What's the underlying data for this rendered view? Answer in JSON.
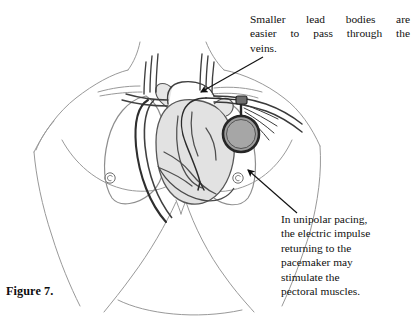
{
  "figure": {
    "caption": "Figure 7.",
    "background_color": "#ffffff",
    "width": 412,
    "height": 324
  },
  "callouts": [
    {
      "id": "veins",
      "name": "callout-smaller-lead-bodies",
      "lines": [
        "Smaller lead bodies are",
        "easier to pass through the",
        "veins."
      ],
      "justified_words": [
        [
          "Smaller",
          "lead",
          "bodies",
          "are"
        ],
        [
          "easier",
          "to",
          "pass",
          "through",
          "the"
        ],
        [
          "veins."
        ]
      ],
      "full_text": "Smaller lead bodies are easier to pass through the veins.",
      "arrow_target": "subclavian-vein-entry"
    },
    {
      "id": "unipolar",
      "name": "callout-unipolar-pacing",
      "lines": [
        "In unipolar pacing,",
        "the electric impulse",
        "returning to the",
        "pacemaker may",
        "stimulate the",
        "pectoral muscles."
      ],
      "full_text": "In unipolar pacing, the electric impulse returning to the pacemaker may stimulate the pectoral muscles.",
      "arrow_target": "pectoral-muscle-region"
    }
  ],
  "illustration": {
    "subject": "female-torso-anterior-view",
    "label": "Anterior view of chest showing implanted pacemaker with transvenous leads",
    "colors": {
      "body_outline": "#8a8a8a",
      "body_outline_light": "#a8a8a8",
      "vessel_outline": "#3a3a3a",
      "vessel_fill": "#e8e8e8",
      "heart_fill": "#e0e0e0",
      "heart_outline": "#4a4a4a",
      "lung_outline": "#9a9a9a",
      "device_ring": "#2b2b2b",
      "device_fill": "#9e9e9e",
      "lead_wire": "#2f2f2f",
      "arrow": "#111111"
    },
    "parts": [
      {
        "name": "torso-outline",
        "label": "Torso and shoulders outline"
      },
      {
        "name": "left-lung",
        "label": "Left lung (viewer right)"
      },
      {
        "name": "right-lung",
        "label": "Right lung (viewer left)"
      },
      {
        "name": "heart",
        "label": "Heart with chambers"
      },
      {
        "name": "great-vessels",
        "label": "Aortic arch and great vessels"
      },
      {
        "name": "subclavian-vein",
        "label": "Subclavian vein"
      },
      {
        "name": "pacemaker-device",
        "label": "Implanted pacemaker generator (can)"
      },
      {
        "name": "pacemaker-lead",
        "label": "Transvenous pacing lead into right ventricle"
      },
      {
        "name": "left-nipple",
        "label": "Nipple marker left"
      },
      {
        "name": "right-nipple",
        "label": "Nipple marker right"
      },
      {
        "name": "breast-contour",
        "label": "Breast contour lines"
      },
      {
        "name": "rib-margin",
        "label": "Costal margin / abdominal outline"
      }
    ],
    "arrows": [
      {
        "name": "arrow-to-veins",
        "from": [
          262,
          58
        ],
        "to": [
          199,
          93
        ]
      },
      {
        "name": "arrow-to-pectoral",
        "from": [
          296,
          214
        ],
        "to": [
          246,
          170
        ]
      }
    ]
  }
}
